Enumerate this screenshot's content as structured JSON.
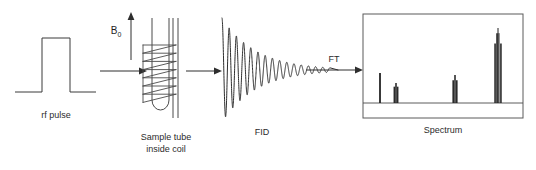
{
  "figure": {
    "background_color": "#ffffff",
    "line_color": "#2e2e2e"
  },
  "stages": {
    "rf_pulse": {
      "label": "rf pulse",
      "shape": "square-pulse",
      "baseline_y": 92,
      "pulse_top_y": 38,
      "pulse_left_x": 42,
      "pulse_right_x": 70,
      "line_start_x": 15,
      "line_end_x": 96
    },
    "sample_tube": {
      "label_line1": "Sample tube",
      "label_line2": "inside coil",
      "field_label": "B",
      "field_subscript": "0",
      "coil_turns": 7,
      "tube_top_y": 18,
      "tube_bottom_y": 110
    },
    "fid": {
      "label": "FID",
      "description": "exponentially damped oscillation",
      "start_x": 222,
      "end_x": 330,
      "center_y": 70,
      "initial_amplitude": 52,
      "decay_constant": 34,
      "cycles": 15
    },
    "fourier_transform": {
      "label": "FT"
    },
    "spectrum": {
      "label": "Spectrum",
      "box": {
        "x": 363,
        "y": 14,
        "width": 160,
        "height": 104
      },
      "baseline_y": 103
    }
  },
  "chart_data": {
    "type": "line",
    "title": "Spectrum",
    "xlabel": "",
    "ylabel": "",
    "grid": false,
    "legend": false,
    "xlim": [
      363,
      523
    ],
    "ylim": [
      0,
      80
    ],
    "baseline_y": 103,
    "peaks": [
      {
        "name": "peak-1",
        "x": 380,
        "height": 30,
        "width": 1.0,
        "multiplet": 1
      },
      {
        "name": "peak-2",
        "x": 396,
        "height": 20,
        "width": 2.2,
        "multiplet": 3
      },
      {
        "name": "peak-3",
        "x": 455,
        "height": 28,
        "width": 2.4,
        "multiplet": 3
      },
      {
        "name": "peak-4",
        "x": 498,
        "height": 75,
        "width": 2.6,
        "multiplet": 4
      }
    ]
  },
  "arrows": [
    {
      "name": "arrow-pulse-to-tube",
      "x1": 100,
      "y1": 71,
      "x2": 143,
      "y2": 71,
      "direction": "right"
    },
    {
      "name": "arrow-tube-to-fid",
      "x1": 186,
      "y1": 71,
      "x2": 222,
      "y2": 71,
      "direction": "right"
    },
    {
      "name": "arrow-b0-field",
      "x1": 131,
      "y1": 58,
      "x2": 131,
      "y2": 14,
      "direction": "up"
    },
    {
      "name": "arrow-ft",
      "x1": 306,
      "y1": 70,
      "x2": 361,
      "y2": 70,
      "direction": "right"
    }
  ],
  "labels": {
    "rf_pulse": "rf pulse",
    "sample_tube_line1": "Sample tube",
    "sample_tube_line2": "inside coil",
    "fid": "FID",
    "ft": "FT",
    "spectrum": "Spectrum",
    "b0": "B",
    "b0_sub": "0"
  }
}
